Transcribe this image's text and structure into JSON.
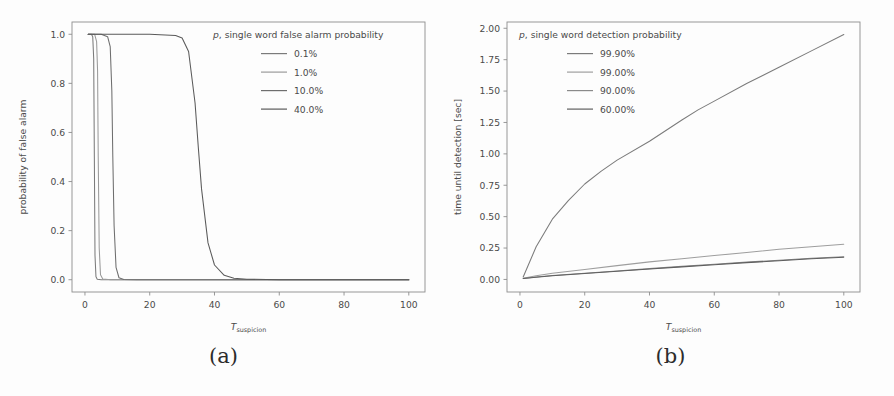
{
  "figure": {
    "caption_a": "(a)",
    "caption_b": "(b)"
  },
  "chart_data": [
    {
      "panel": "a",
      "type": "line",
      "title": "",
      "xlabel": "T_suspicion",
      "xlabel_base": "T",
      "xlabel_sub": "suspicion",
      "ylabel": "probability of false alarm",
      "xlim": [
        -4,
        105
      ],
      "ylim": [
        -0.05,
        1.05
      ],
      "xticks": [
        0,
        20,
        40,
        60,
        80,
        100
      ],
      "yticks": [
        0.0,
        0.2,
        0.4,
        0.6,
        0.8,
        1.0
      ],
      "xtick_labels": [
        "0",
        "20",
        "40",
        "60",
        "80",
        "100"
      ],
      "ytick_labels": [
        "0.0",
        "0.2",
        "0.4",
        "0.6",
        "0.8",
        "1.0"
      ],
      "grid": false,
      "legend_position": "upper right",
      "legend_title": "p, single word false alarm probability",
      "legend_title_italic_prefix": "p",
      "legend_title_rest": ", single word false alarm probability",
      "series": [
        {
          "name": "0.1%",
          "color": "#7b7b7b",
          "drop_center": 2.9,
          "drop_width": 0.55,
          "x": [
            1,
            2,
            2.4,
            2.7,
            2.9,
            3.1,
            3.4,
            3.8,
            5,
            10,
            20,
            40,
            60,
            80,
            100
          ],
          "values": [
            1.0,
            1.0,
            0.99,
            0.9,
            0.5,
            0.1,
            0.012,
            0.002,
            0.0,
            0.0,
            0.0,
            0.0,
            0.0,
            0.0,
            0.0
          ]
        },
        {
          "name": "1.0%",
          "color": "#9a9a9a",
          "drop_center": 4.1,
          "drop_width": 0.7,
          "x": [
            1,
            2,
            3,
            3.6,
            3.9,
            4.1,
            4.4,
            4.8,
            5.5,
            8,
            15,
            30,
            50,
            75,
            100
          ],
          "values": [
            1.0,
            1.0,
            1.0,
            0.97,
            0.85,
            0.5,
            0.13,
            0.02,
            0.003,
            0.0,
            0.0,
            0.0,
            0.0,
            0.0,
            0.0
          ]
        },
        {
          "name": "10.0%",
          "color": "#6e6e6e",
          "drop_center": 8.6,
          "drop_width": 1.3,
          "x": [
            1,
            3,
            5,
            7,
            7.8,
            8.3,
            8.6,
            9.0,
            9.6,
            10.5,
            12,
            16,
            25,
            50,
            100
          ],
          "values": [
            1.0,
            1.0,
            1.0,
            0.99,
            0.95,
            0.77,
            0.5,
            0.22,
            0.05,
            0.008,
            0.001,
            0.0,
            0.0,
            0.0,
            0.0
          ]
        },
        {
          "name": "40.0%",
          "color": "#5a5a5a",
          "drop_center": 34.5,
          "drop_width": 4.2,
          "x": [
            1,
            10,
            20,
            28,
            30,
            32,
            34,
            35,
            36,
            38,
            40,
            43,
            46,
            50,
            60,
            80,
            100
          ],
          "values": [
            1.0,
            1.0,
            1.0,
            0.995,
            0.985,
            0.93,
            0.72,
            0.54,
            0.37,
            0.15,
            0.06,
            0.018,
            0.006,
            0.002,
            0.0,
            0.0,
            0.0
          ]
        }
      ]
    },
    {
      "panel": "b",
      "type": "line",
      "title": "",
      "xlabel": "T_suspicion",
      "xlabel_base": "T",
      "xlabel_sub": "suspicion",
      "ylabel": "time until detection [sec]",
      "xlim": [
        -4,
        105
      ],
      "ylim": [
        -0.1,
        2.05
      ],
      "xticks": [
        0,
        20,
        40,
        60,
        80,
        100
      ],
      "yticks": [
        0.0,
        0.25,
        0.5,
        0.75,
        1.0,
        1.25,
        1.5,
        1.75,
        2.0
      ],
      "xtick_labels": [
        "0",
        "20",
        "40",
        "60",
        "80",
        "100"
      ],
      "ytick_labels": [
        "0.00",
        "0.25",
        "0.50",
        "0.75",
        "1.00",
        "1.25",
        "1.50",
        "1.75",
        "2.00"
      ],
      "grid": false,
      "legend_position": "upper left",
      "legend_title": "p, single word detection probability",
      "legend_title_italic_prefix": "p",
      "legend_title_rest": ", single word detection probability",
      "series": [
        {
          "name": "99.90%",
          "color": "#7b7b7b",
          "x": [
            1,
            5,
            10,
            15,
            20,
            25,
            30,
            40,
            50,
            55,
            60,
            70,
            80,
            90,
            100
          ],
          "values": [
            0.02,
            0.26,
            0.48,
            0.63,
            0.76,
            0.86,
            0.95,
            1.1,
            1.27,
            1.35,
            1.42,
            1.56,
            1.69,
            1.82,
            1.95
          ]
        },
        {
          "name": "99.00%",
          "color": "#9e9e9e",
          "x": [
            1,
            5,
            10,
            20,
            30,
            40,
            50,
            60,
            70,
            80,
            90,
            100
          ],
          "values": [
            0.01,
            0.03,
            0.05,
            0.08,
            0.11,
            0.14,
            0.165,
            0.19,
            0.215,
            0.24,
            0.26,
            0.28
          ]
        },
        {
          "name": "90.00%",
          "color": "#8a8a8a",
          "x": [
            1,
            5,
            10,
            20,
            30,
            40,
            50,
            60,
            70,
            80,
            90,
            100
          ],
          "values": [
            0.008,
            0.019,
            0.031,
            0.05,
            0.068,
            0.086,
            0.104,
            0.121,
            0.138,
            0.153,
            0.168,
            0.181
          ]
        },
        {
          "name": "60.00%",
          "color": "#5f5f5f",
          "x": [
            1,
            5,
            10,
            20,
            30,
            40,
            50,
            60,
            70,
            80,
            90,
            100
          ],
          "values": [
            0.007,
            0.017,
            0.029,
            0.047,
            0.065,
            0.083,
            0.1,
            0.117,
            0.134,
            0.149,
            0.164,
            0.177
          ]
        }
      ]
    }
  ]
}
